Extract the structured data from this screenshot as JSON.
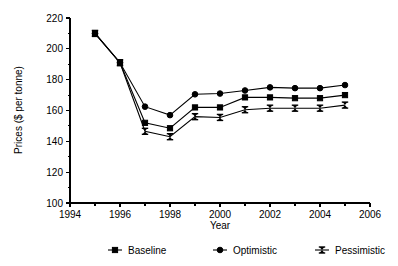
{
  "chart_data": {
    "type": "line",
    "title": "",
    "xlabel": "Year",
    "ylabel": "Prices ($ per tonne)",
    "xlim": [
      1994,
      2006
    ],
    "ylim": [
      100,
      220
    ],
    "x_major_ticks": [
      1994,
      1996,
      1998,
      2000,
      2002,
      2004,
      2006
    ],
    "x_minor_ticks": [
      1995,
      1997,
      1999,
      2001,
      2003,
      2005
    ],
    "x_tick_labels": [
      "1994",
      "1996",
      "1998",
      "2000",
      "2002",
      "2004",
      "2006"
    ],
    "y_major_ticks": [
      100,
      120,
      140,
      160,
      180,
      200,
      220
    ],
    "y_minor_ticks": [
      110,
      130,
      150,
      170,
      190,
      210
    ],
    "y_tick_labels": [
      "100",
      "120",
      "140",
      "160",
      "180",
      "200",
      "220"
    ],
    "grid": false,
    "legend_position": "bottom",
    "x": [
      1995,
      1996,
      1997,
      1998,
      1999,
      2000,
      2001,
      2002,
      2003,
      2004,
      2005
    ],
    "series": [
      {
        "name": "Baseline",
        "marker": "square",
        "values": [
          210,
          191,
          152,
          148.5,
          162,
          162,
          168.5,
          168.5,
          168,
          168,
          170
        ]
      },
      {
        "name": "Optimistic",
        "marker": "circle",
        "values": [
          210,
          191,
          162.5,
          157,
          170.5,
          171,
          173,
          175,
          174.5,
          174.5,
          176.5
        ]
      },
      {
        "name": "Pessimistic",
        "marker": "bowtie",
        "values": [
          210,
          191,
          146.5,
          143,
          156,
          155.5,
          160.5,
          161.5,
          161.5,
          161.5,
          163.5
        ]
      }
    ]
  },
  "legend": {
    "items": [
      {
        "label": "Baseline"
      },
      {
        "label": "Optimistic"
      },
      {
        "label": "Pessimistic"
      }
    ]
  },
  "colors": {
    "ink": "#000000",
    "background": "#ffffff"
  }
}
